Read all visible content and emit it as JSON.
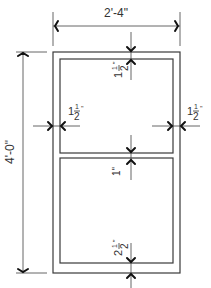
{
  "drawing": {
    "title": "Window elevation",
    "overall_width": "2'-4\"",
    "overall_height": "4'-0\"",
    "top_frame": {
      "whole": "1",
      "num": "1",
      "den": "2",
      "unit": "\""
    },
    "left_frame": {
      "whole": "1",
      "num": "1",
      "den": "2",
      "unit": "\""
    },
    "right_frame": {
      "whole": "1",
      "num": "1",
      "den": "2",
      "unit": "\""
    },
    "mullion": "1\"",
    "bottom_frame": {
      "whole": "2",
      "num": "1",
      "den": "2",
      "unit": "\""
    },
    "line_color": "#3a3a3a"
  }
}
